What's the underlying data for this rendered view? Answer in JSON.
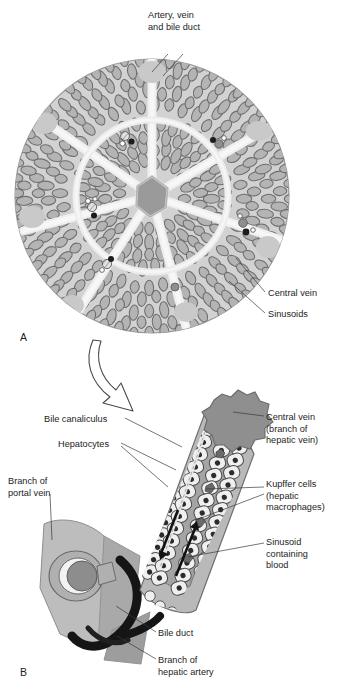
{
  "figure": {
    "type": "anatomical-diagram",
    "background": "#ffffff",
    "panels": [
      {
        "id": "A",
        "letter": "A",
        "caption": "Cross-section of a hepatic lobule showing radiating sinusoids, portal triads and the central vein"
      },
      {
        "id": "B",
        "letter": "B",
        "caption": "Enlarged detail of a liver sinusoid with hepatocyte cords, Kupffer cells, portal triad and central vein"
      }
    ],
    "transition_arrow": {
      "name": "magnify-arrow",
      "from_panel": "A",
      "to_panel": "B",
      "style": "hollow-curved-arrow"
    }
  },
  "palette": {
    "lobule_fill": "#d2d2d2",
    "lobule_stroke": "#8c8c8c",
    "septum_fill": "#eeeeee",
    "cord_stroke": "#6e6e6e",
    "cord_fill": "#b4b4b4",
    "central_vein_fill": "#9a9a9a",
    "vessel_dark": "#1c1c1c",
    "vessel_mid": "#8f8f8f",
    "vessel_light": "#e6e6e6",
    "sinusoid_fill": "#a8a8a8",
    "hepatocyte_fill": "#efefef",
    "hepatocyte_stroke": "#4a4a4a",
    "nucleus_fill": "#2b2b2b",
    "parenchyma_fill": "#b9b9b9",
    "bile_duct_black": "#151515",
    "text": "#1d1d1d",
    "leader_line": "#3a3a3a"
  },
  "panelA": {
    "letter": "A",
    "labels": [
      {
        "id": "artery-vein-bile-duct",
        "lines": [
          "Artery, vein",
          "and bile duct"
        ],
        "x": 148,
        "y": 18,
        "anchor": "start",
        "leaders": 2
      },
      {
        "id": "central-vein",
        "lines": [
          "Central vein"
        ],
        "x": 268,
        "y": 296,
        "anchor": "start",
        "leaders": 1
      },
      {
        "id": "sinusoids",
        "lines": [
          "Sinusoids"
        ],
        "x": 268,
        "y": 317,
        "anchor": "start",
        "leaders": 1
      }
    ]
  },
  "panelB": {
    "letter": "B",
    "labels": [
      {
        "id": "bile-canaliculus",
        "lines": [
          "Bile canaliculus"
        ],
        "x": 44,
        "y": 422,
        "anchor": "start"
      },
      {
        "id": "hepatocytes",
        "lines": [
          "Hepatocytes"
        ],
        "x": 58,
        "y": 447,
        "anchor": "start"
      },
      {
        "id": "branch-of-portal-vein",
        "lines": [
          "Branch of",
          "portal vein"
        ],
        "x": 8,
        "y": 484,
        "anchor": "start"
      },
      {
        "id": "central-vein-hepatic",
        "lines": [
          "Central vein",
          "(branch of",
          "hepatic vein)"
        ],
        "x": 266,
        "y": 420,
        "anchor": "start"
      },
      {
        "id": "kupffer-cells",
        "lines": [
          "Kupffer cells",
          "(hepatic",
          "macrophages)"
        ],
        "x": 266,
        "y": 487,
        "anchor": "start"
      },
      {
        "id": "sinusoid-containing-blood",
        "lines": [
          "Sinusoid",
          "containing",
          "blood"
        ],
        "x": 266,
        "y": 545,
        "anchor": "start"
      },
      {
        "id": "bile-duct",
        "lines": [
          "Bile duct"
        ],
        "x": 158,
        "y": 636,
        "anchor": "start"
      },
      {
        "id": "branch-of-hepatic-artery",
        "lines": [
          "Branch of",
          "hepatic artery"
        ],
        "x": 158,
        "y": 663,
        "anchor": "start"
      }
    ],
    "flow_arrows": [
      {
        "id": "bile-flow-arrow",
        "direction": "down-left",
        "meaning": "bile flow toward bile duct"
      },
      {
        "id": "blood-flow-arrow",
        "direction": "up-right",
        "meaning": "blood flow toward central vein"
      }
    ]
  }
}
